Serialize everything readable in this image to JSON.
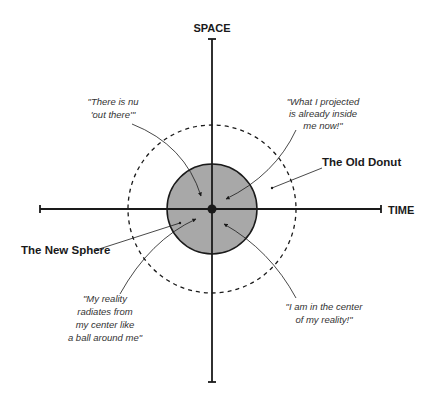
{
  "axes": {
    "vertical_label": "SPACE",
    "horizontal_label": "TIME"
  },
  "regions": {
    "outer_label": "The Old Donut",
    "inner_label": "The New Sphere"
  },
  "quotes": {
    "top_left": [
      "\"There is nu",
      "'out there'\""
    ],
    "top_right": [
      "\"What I projected",
      "is already inside",
      "me now!\""
    ],
    "bottom_left": [
      "\"My reality",
      "radiates from",
      "my center like",
      "a ball around me\""
    ],
    "bottom_right": [
      "\"I am in the center",
      "of my reality!\""
    ]
  },
  "colors": {
    "line": "#1a1a1a",
    "sphere_fill": "#a8a8a8",
    "background": "#ffffff"
  }
}
